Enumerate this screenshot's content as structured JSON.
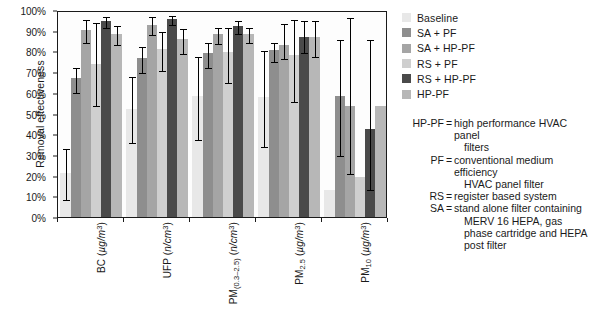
{
  "chart_data": {
    "type": "bar",
    "title": "",
    "xlabel": "",
    "ylabel": "Removal effectiveness",
    "ylim": [
      0,
      100
    ],
    "ytick_labels": [
      "0%",
      "10%",
      "20%",
      "30%",
      "40%",
      "50%",
      "60%",
      "70%",
      "80%",
      "90%",
      "100%"
    ],
    "ytick_values": [
      0,
      10,
      20,
      30,
      40,
      50,
      60,
      70,
      80,
      90,
      100
    ],
    "grid": false,
    "legend_position": "right",
    "categories": [
      "BC (µg/m³)",
      "UFP (n/cm³)",
      "PM(0.3–2.5) (n/cm³)",
      "PM2.5 (µg/m³)",
      "PM10 (µg/m³)"
    ],
    "category_parts": [
      {
        "base": "BC",
        "sub": "",
        "unit_pre": " (",
        "unit": "µg/m",
        "unit_sup": "3",
        "unit_post": ")"
      },
      {
        "base": "UFP",
        "sub": "",
        "unit_pre": " (",
        "unit": "n/cm",
        "unit_sup": "3",
        "unit_post": ")"
      },
      {
        "base": "PM",
        "sub": "(0.3–2.5)",
        "unit_pre": " (",
        "unit": "n/cm",
        "unit_sup": "3",
        "unit_post": ")"
      },
      {
        "base": "PM",
        "sub": "2.5",
        "unit_pre": " (",
        "unit": "µg/m",
        "unit_sup": "3",
        "unit_post": ")"
      },
      {
        "base": "PM",
        "sub": "10",
        "unit_pre": " (",
        "unit": "µg/m",
        "unit_sup": "3",
        "unit_post": ")"
      }
    ],
    "series": [
      {
        "name": "Baseline",
        "color": "#e8e8e8",
        "values": [
          21.5,
          52.0,
          58.5,
          58.0,
          13.0
        ],
        "err_low": [
          9.0,
          36.5,
          38.0,
          35.0,
          null
        ],
        "err_high": [
          34.0,
          68.5,
          78.5,
          81.0,
          null
        ]
      },
      {
        "name": "SA + PF",
        "color": "#8e8e8e",
        "values": [
          67.0,
          77.0,
          79.0,
          80.5,
          58.5
        ],
        "err_low": [
          61.0,
          70.5,
          73.0,
          76.0,
          30.5
        ],
        "err_high": [
          73.0,
          83.0,
          85.0,
          85.0,
          86.5
        ]
      },
      {
        "name": "SA + HP-PF",
        "color": "#a5a5a5",
        "values": [
          90.5,
          93.0,
          88.5,
          83.0,
          53.5
        ],
        "err_low": [
          85.0,
          89.0,
          84.5,
          77.5,
          21.5
        ],
        "err_high": [
          96.0,
          97.5,
          92.5,
          94.0,
          97.0
        ]
      },
      {
        "name": "RS + PF",
        "color": "#cfcfcf",
        "values": [
          74.0,
          81.0,
          79.5,
          78.5,
          19.5
        ],
        "err_low": [
          54.5,
          71.5,
          65.5,
          56.5,
          null
        ],
        "err_high": [
          94.5,
          90.5,
          92.5,
          96.0,
          85.0
        ]
      },
      {
        "name": "RS + HP-PF",
        "color": "#4a4a4a",
        "values": [
          94.5,
          95.5,
          92.5,
          87.0,
          42.5
        ],
        "err_low": [
          92.5,
          93.5,
          89.5,
          80.0,
          14.0
        ],
        "err_high": [
          97.5,
          98.0,
          95.5,
          95.5,
          86.5
        ]
      },
      {
        "name": "HP-PF",
        "color": "#b7b7b7",
        "values": [
          88.5,
          86.0,
          88.5,
          87.0,
          53.5
        ],
        "err_low": [
          84.0,
          79.5,
          85.0,
          78.5,
          null
        ],
        "err_high": [
          93.0,
          92.0,
          92.5,
          95.5,
          89.5
        ]
      }
    ]
  },
  "legend": {
    "items": [
      {
        "label": "Baseline",
        "color": "#e8e8e8"
      },
      {
        "label": "SA + PF",
        "color": "#8e8e8e"
      },
      {
        "label": "SA + HP-PF",
        "color": "#a5a5a5"
      },
      {
        "label": "RS + PF",
        "color": "#cfcfcf"
      },
      {
        "label": "RS + HP-PF",
        "color": "#4a4a4a"
      },
      {
        "label": "HP-PF",
        "color": "#b7b7b7"
      }
    ]
  },
  "notes": [
    {
      "key": "HP-PF",
      "eq": "=",
      "value": "high performance HVAC panel",
      "continuation": "filters"
    },
    {
      "key": "PF",
      "eq": "=",
      "value": "conventional medium efficiency",
      "continuation": "HVAC panel filter"
    },
    {
      "key": "RS",
      "eq": "=",
      "value": "register based system",
      "continuation": ""
    },
    {
      "key": "SA",
      "eq": "=",
      "value": "stand alone filter containing",
      "continuation": "MERV 16 HEPA, gas phase cartridge and HEPA post filter"
    }
  ]
}
